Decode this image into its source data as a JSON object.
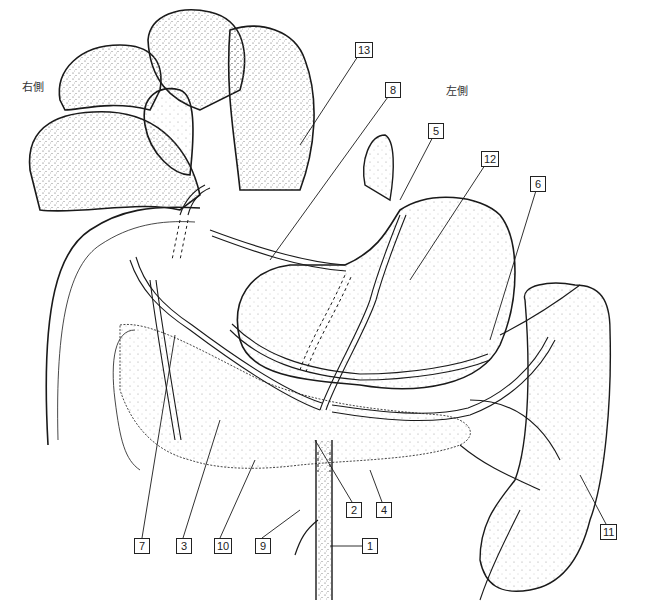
{
  "diagram": {
    "type": "anatomical illustration",
    "orientation_labels": {
      "right": "右側",
      "left": "左側"
    },
    "callouts": [
      {
        "id": "1",
        "label": "1",
        "x": 362,
        "y": 538
      },
      {
        "id": "2",
        "label": "2",
        "x": 346,
        "y": 502
      },
      {
        "id": "3",
        "label": "3",
        "x": 176,
        "y": 538
      },
      {
        "id": "4",
        "label": "4",
        "x": 376,
        "y": 502
      },
      {
        "id": "5",
        "label": "5",
        "x": 428,
        "y": 123
      },
      {
        "id": "6",
        "label": "6",
        "x": 530,
        "y": 176
      },
      {
        "id": "7",
        "label": "7",
        "x": 134,
        "y": 538
      },
      {
        "id": "8",
        "label": "8",
        "x": 385,
        "y": 82
      },
      {
        "id": "9",
        "label": "9",
        "x": 255,
        "y": 538
      },
      {
        "id": "10",
        "label": "10",
        "x": 214,
        "y": 538
      },
      {
        "id": "11",
        "label": "11",
        "x": 600,
        "y": 524
      },
      {
        "id": "12",
        "label": "12",
        "x": 481,
        "y": 151
      },
      {
        "id": "13",
        "label": "13",
        "x": 355,
        "y": 42
      }
    ],
    "colors": {
      "line": "#1a1a1a",
      "stipple": "#555555",
      "background": "#ffffff"
    }
  }
}
